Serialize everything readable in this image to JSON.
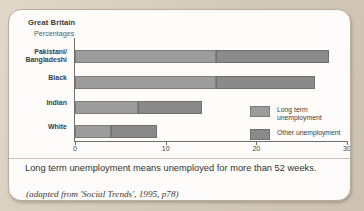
{
  "card": {
    "title": "Great Britain",
    "subtitle": "Percentages"
  },
  "caption": "Long term unemployment means unemployed for more than 52 weeks.",
  "source": "(adapted from 'Social Trends', 1995, p78)",
  "legend": {
    "items": [
      {
        "label": "Long term\nunemployment",
        "color": "#9c9c9c",
        "key": "long-term"
      },
      {
        "label": "Other unemployment",
        "color": "#8a8a8a",
        "key": "other"
      }
    ]
  },
  "axis": {
    "ticks": [
      "0",
      "10",
      "20",
      "30"
    ],
    "tick_values": [
      0,
      10,
      20,
      30
    ]
  },
  "categories": [
    "Pakistani/\nBangladeshi",
    "Black",
    "Indian",
    "White"
  ],
  "chart_data": {
    "type": "bar",
    "orientation": "horizontal",
    "stacked": true,
    "title": "Great Britain",
    "subtitle": "Percentages",
    "xlabel": "",
    "ylabel": "",
    "unit": "Percentages",
    "xlim": [
      0,
      30
    ],
    "grid": false,
    "legend_position": "inside-right",
    "categories": [
      "Pakistani/Bangladeshi",
      "Black",
      "Indian",
      "White"
    ],
    "series": [
      {
        "name": "Long term unemployment",
        "color": "#9c9c9c",
        "values": [
          15.5,
          15.5,
          7.0,
          4.0
        ]
      },
      {
        "name": "Other unemployment",
        "color": "#8a8a8a",
        "values": [
          12.5,
          11.0,
          7.0,
          5.0
        ]
      }
    ],
    "totals": [
      28.0,
      26.5,
      14.0,
      9.0
    ],
    "annotations": [
      "Long term unemployment means unemployed for more than 52 weeks.",
      "(adapted from 'Social Trends', 1995, p78)"
    ]
  }
}
